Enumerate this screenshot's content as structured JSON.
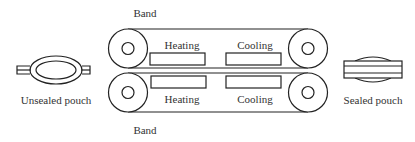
{
  "diagram": {
    "labels": {
      "top_band": "Band",
      "bottom_band": "Band",
      "top_heating": "Heating",
      "top_cooling": "Cooling",
      "bottom_heating": "Heating",
      "bottom_cooling": "Cooling",
      "input": "Unsealed pouch",
      "output": "Sealed pouch"
    },
    "colors": {
      "stroke": "#222222",
      "text": "#333333",
      "background": "#ffffff"
    }
  }
}
